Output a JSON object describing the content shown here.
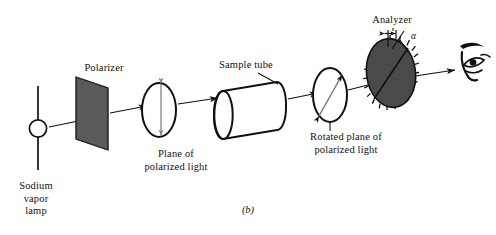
{
  "figure": {
    "caption": "(b)",
    "background": "#ffffff",
    "ink": "#111111",
    "polarizer_fill": "#5a5a5a",
    "analyzer_fill": "#4a4a4a"
  },
  "labels": {
    "polarizer": "Polarizer",
    "sample_tube": "Sample tube",
    "analyzer": "Analyzer",
    "angle_symbol": "α",
    "plane_of_polarized_light": "Plane of\npolarized light",
    "rotated_plane_of_polarized_light": "Rotated plane of\npolarized light",
    "sodium_vapor_lamp": "Sodium\nvapor\nlamp"
  },
  "components": [
    {
      "name": "sodium-vapor-lamp",
      "label": "Sodium vapor lamp"
    },
    {
      "name": "polarizer",
      "label": "Polarizer"
    },
    {
      "name": "plane-of-polarized-light",
      "label": "Plane of polarized light"
    },
    {
      "name": "sample-tube",
      "label": "Sample tube"
    },
    {
      "name": "rotated-plane-of-polarized-light",
      "label": "Rotated plane of polarized light"
    },
    {
      "name": "analyzer",
      "label": "Analyzer"
    },
    {
      "name": "observer-eye",
      "label": "Eye"
    }
  ]
}
